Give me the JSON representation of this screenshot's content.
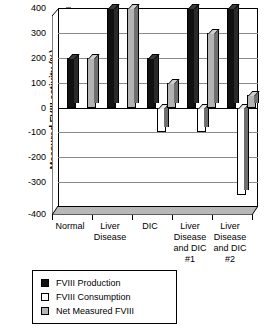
{
  "chart_data": {
    "type": "bar",
    "title": "",
    "xlabel": "",
    "ylabel": "Measured FVIII activity (%)",
    "ylim": [
      -400,
      400
    ],
    "ytick_values": [
      400,
      300,
      200,
      100,
      0,
      -100,
      -200,
      -300,
      -400
    ],
    "ytick_labels": [
      "400",
      "300",
      "200",
      "100",
      "0",
      "-100",
      "-200",
      "-300",
      "-400"
    ],
    "grid": true,
    "grid_axis": "y",
    "legend_position": "below-plot-left",
    "categories": [
      "Normal",
      "Liver Disease",
      "DIC",
      "Liver Disease and DIC #1",
      "Liver Disease and DIC #2"
    ],
    "category_lines": [
      [
        "Normal"
      ],
      [
        "Liver",
        "Disease"
      ],
      [
        "DIC"
      ],
      [
        "Liver",
        "Disease",
        "and DIC",
        "#1"
      ],
      [
        "Liver",
        "Disease",
        "and DIC",
        "#2"
      ]
    ],
    "series": [
      {
        "name": "FVIII Production",
        "color": "#111111",
        "values": [
          200,
          400,
          200,
          400,
          400
        ]
      },
      {
        "name": "FVIII Consumption",
        "color": "#ffffff",
        "values": [
          0,
          0,
          -100,
          -100,
          -350
        ]
      },
      {
        "name": "Net Measured FVIII",
        "color": "#b4b4b4",
        "values": [
          200,
          400,
          100,
          300,
          50
        ]
      }
    ]
  },
  "legend": {
    "items": [
      {
        "label": "FVIII Production",
        "swatch": "prod"
      },
      {
        "label": "FVIII Consumption",
        "swatch": "cons"
      },
      {
        "label": "Net Measured FVIII",
        "swatch": "net"
      }
    ]
  }
}
